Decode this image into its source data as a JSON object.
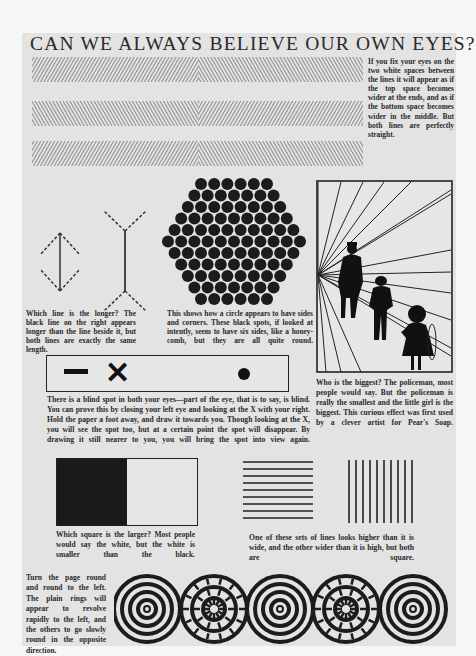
{
  "page": {
    "title": "CAN WE ALWAYS BELIEVE OUR OWN EYES?"
  },
  "illusions": {
    "parallel_lines": {
      "caption": "If you fix your eyes on the two white spaces between the lines it will appear as if the top space becomes wider at the ends, and as if the bottom space becomes wider in the middle. But both lines are perfectly straight."
    },
    "muller_lyer": {
      "caption": "Which line is the longer? The black line on the right appears longer than the line beside it, but both lines are exactly the same length."
    },
    "hexagon_circles": {
      "caption": "This shows how a circle appears to have sides and corners. These black spots, if looked at intently, seem to have six sides, like a honey-comb, but they are all quite round."
    },
    "perspective": {
      "caption": "Who is the biggest? The policeman, most people would say. But the policeman is really the smallest and the little girl is the biggest. This curious effect was first used by a clever artist for Pear's Soap."
    },
    "blind_spot": {
      "symbols": [
        "—",
        "✕",
        "●"
      ],
      "caption": "There is a blind spot in both your eyes—part of the eye, that is to say, is blind. You can prove this by closing your left eye and looking at the X with your right. Hold the paper a foot away, and draw it towards you. Though looking at the X, you will see the spot too, but at a certain point the spot will disappear. By drawing it still nearer to you, you will bring the spot into view again."
    },
    "squares": {
      "caption": "Which square is the larger? Most people would say the white, but the white is smaller than the black."
    },
    "line_sets": {
      "caption": "One of these sets of lines looks higher than it is wide, and the other wider than it is high, but both are square."
    },
    "rings": {
      "caption": "Turn the page round and round to the left. The plain rings will appear to revolve rapidly to the left, and the others to go slowly round in the opposite direction."
    }
  },
  "colors": {
    "page_bg": "#e3e3e3",
    "ink": "#2a2a2a",
    "outer_bg": "#f6f6f6"
  }
}
